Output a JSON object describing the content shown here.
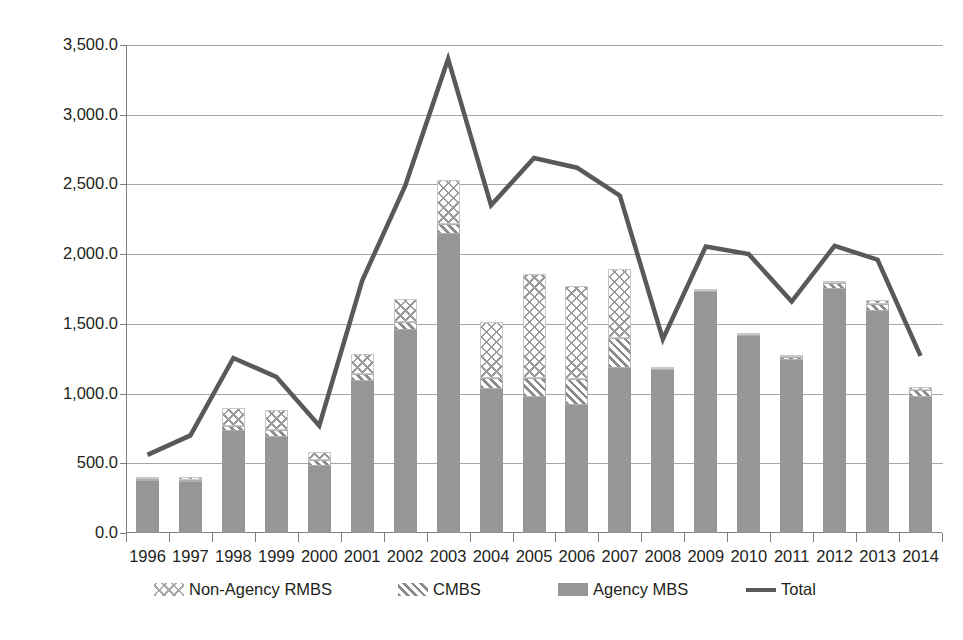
{
  "chart_data": {
    "type": "bar",
    "title": "",
    "subtitle": "",
    "xlabel": "",
    "ylabel": "",
    "ylim": [
      0,
      3500
    ],
    "ytick_step": 500,
    "grid": true,
    "legend_position": "bottom",
    "categories": [
      "1996",
      "1997",
      "1998",
      "1999",
      "2000",
      "2001",
      "2002",
      "2003",
      "2004",
      "2005",
      "2006",
      "2007",
      "2008",
      "2009",
      "2010",
      "2011",
      "2012",
      "2013",
      "2014"
    ],
    "ytick_labels": [
      "0.0",
      "500.0",
      "1,000.0",
      "1,500.0",
      "2,000.0",
      "2,500.0",
      "3,000.0",
      "3,500.0"
    ],
    "ytick_values": [
      0,
      500,
      1000,
      1500,
      2000,
      2500,
      3000,
      3500
    ],
    "stacked": true,
    "series": [
      {
        "name": "Agency MBS",
        "type": "bar",
        "stack_order": 0,
        "color": "#969696",
        "pattern": "solid",
        "values": [
          370,
          365,
          730,
          685,
          480,
          1090,
          1455,
          2145,
          1030,
          975,
          920,
          1180,
          1170,
          1740,
          1420,
          1240,
          1750,
          1590,
          975
        ]
      },
      {
        "name": "CMBS",
        "type": "bar",
        "stack_order": 1,
        "color": "#8c8c8c",
        "pattern": "diagonal-hatch",
        "values": [
          15,
          18,
          40,
          55,
          45,
          50,
          55,
          70,
          80,
          140,
          185,
          215,
          10,
          5,
          10,
          25,
          45,
          55,
          50
        ]
      },
      {
        "name": "Non-Agency RMBS",
        "type": "bar",
        "stack_order": 2,
        "color": "#9a9a9a",
        "pattern": "cross-hatch",
        "values": [
          15,
          20,
          130,
          145,
          55,
          145,
          170,
          315,
          400,
          745,
          670,
          495,
          10,
          5,
          5,
          10,
          15,
          25,
          20
        ]
      },
      {
        "name": "Total",
        "type": "line",
        "color": "#595959",
        "values": [
          560,
          700,
          1255,
          1120,
          770,
          1810,
          2490,
          3400,
          2350,
          2690,
          2620,
          2420,
          1390,
          2055,
          2000,
          1660,
          2060,
          1960,
          1270
        ]
      }
    ]
  },
  "legend": {
    "items": [
      {
        "label": "Non-Agency RMBS",
        "marker": "cross-hatch-swatch-icon",
        "left": 28
      },
      {
        "label": "CMBS",
        "marker": "diagonal-hatch-swatch-icon",
        "left": 272
      },
      {
        "label": "Agency MBS",
        "marker": "solid-gray-swatch-icon",
        "left": 432
      },
      {
        "label": "Total",
        "marker": "line-swatch-icon",
        "left": 620
      }
    ]
  }
}
